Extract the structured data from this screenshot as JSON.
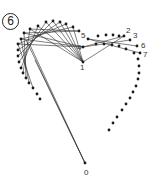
{
  "step": {
    "label": "6"
  },
  "colors": {
    "ink": "#1a1a1a",
    "line": "#2a2a2a",
    "label": "#333333"
  },
  "dots_left": [
    [
      30,
      29
    ],
    [
      38,
      26
    ],
    [
      46,
      22
    ],
    [
      53,
      21
    ],
    [
      60,
      22
    ],
    [
      66,
      24
    ],
    [
      73,
      27
    ],
    [
      79,
      31
    ],
    [
      24,
      33
    ],
    [
      21,
      39
    ],
    [
      18,
      44
    ],
    [
      18,
      50
    ],
    [
      18,
      56
    ],
    [
      19,
      62
    ],
    [
      21,
      68
    ],
    [
      23,
      73
    ],
    [
      26,
      78
    ],
    [
      29,
      83
    ],
    [
      33,
      88
    ],
    [
      37,
      94
    ],
    [
      40,
      99
    ]
  ],
  "dots_right": [
    [
      96,
      44
    ],
    [
      104,
      44
    ],
    [
      112,
      45
    ],
    [
      119,
      46
    ],
    [
      126,
      49
    ],
    [
      134,
      53
    ],
    [
      138,
      59
    ],
    [
      139,
      66
    ],
    [
      139,
      73
    ],
    [
      138,
      79
    ],
    [
      136,
      86
    ],
    [
      133,
      92
    ],
    [
      130,
      98
    ],
    [
      126,
      104
    ],
    [
      122,
      110
    ],
    [
      117,
      117
    ],
    [
      113,
      123
    ],
    [
      109,
      130
    ]
  ],
  "numbered_points": [
    {
      "label": "0",
      "x": 85,
      "y": 163,
      "lx": 84,
      "ly": 175
    },
    {
      "label": "1",
      "x": 83,
      "y": 62,
      "lx": 80,
      "ly": 70
    },
    {
      "label": "2",
      "x": 124,
      "y": 36,
      "lx": 126,
      "ly": 33
    },
    {
      "label": "3",
      "x": 130,
      "y": 40,
      "lx": 133,
      "ly": 38
    },
    {
      "label": "4",
      "x": 83,
      "y": 47,
      "lx": 77,
      "ly": 50
    },
    {
      "label": "5",
      "x": 88,
      "y": 39,
      "lx": 81,
      "ly": 38
    },
    {
      "label": "6",
      "x": 137,
      "y": 46,
      "lx": 141,
      "ly": 48
    },
    {
      "label": "7",
      "x": 140,
      "y": 53,
      "lx": 143,
      "ly": 57
    }
  ],
  "top_right_dots": [
    [
      98,
      36
    ],
    [
      106,
      35
    ],
    [
      113,
      35
    ],
    [
      119,
      36
    ]
  ],
  "lines": [
    [
      30,
      29,
      83,
      62
    ],
    [
      38,
      26,
      83,
      62
    ],
    [
      46,
      22,
      83,
      62
    ],
    [
      53,
      21,
      83,
      62
    ],
    [
      60,
      22,
      83,
      62
    ],
    [
      66,
      24,
      83,
      62
    ],
    [
      73,
      27,
      83,
      62
    ],
    [
      24,
      33,
      83,
      47
    ],
    [
      21,
      39,
      83,
      47
    ],
    [
      18,
      44,
      83,
      47
    ],
    [
      30,
      29,
      79,
      31
    ],
    [
      88,
      39,
      137,
      46
    ],
    [
      88,
      39,
      140,
      53
    ],
    [
      83,
      47,
      124,
      36
    ],
    [
      83,
      47,
      130,
      40
    ],
    [
      83,
      62,
      124,
      36
    ],
    [
      85,
      163,
      35,
      60
    ],
    [
      85,
      163,
      30,
      45
    ],
    [
      85,
      163,
      26,
      40
    ],
    [
      18,
      50,
      60,
      22
    ],
    [
      18,
      56,
      53,
      21
    ],
    [
      19,
      62,
      46,
      22
    ],
    [
      21,
      68,
      38,
      26
    ],
    [
      23,
      73,
      30,
      29
    ],
    [
      26,
      78,
      24,
      33
    ],
    [
      29,
      83,
      21,
      39
    ],
    [
      33,
      88,
      18,
      44
    ],
    [
      18,
      44,
      66,
      24
    ],
    [
      21,
      39,
      73,
      27
    ],
    [
      24,
      33,
      79,
      31
    ]
  ]
}
